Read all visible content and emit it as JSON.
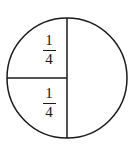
{
  "figure": {
    "type": "fraction-circle-diagram",
    "background_color": "#ffffff",
    "stroke_color": "#1a1a1a",
    "text_color": "#161616",
    "circle": {
      "center_x": 67,
      "center_y": 78,
      "radius": 60,
      "stroke_width": 1.5
    },
    "partitions": [
      {
        "name": "vertical-diameter",
        "description": "full vertical line through the circle",
        "x1": 67,
        "y1": 18,
        "x2": 67,
        "y2": 138
      },
      {
        "name": "left-horizontal-radius",
        "description": "horizontal line from left edge of circle to center",
        "x1": 7,
        "y1": 78,
        "x2": 67,
        "y2": 78
      }
    ],
    "labels": [
      {
        "id": "upper-left",
        "numerator": "1",
        "denominator": "4",
        "text": "1/4"
      },
      {
        "id": "lower-left",
        "numerator": "1",
        "denominator": "4",
        "text": "1/4"
      }
    ]
  }
}
